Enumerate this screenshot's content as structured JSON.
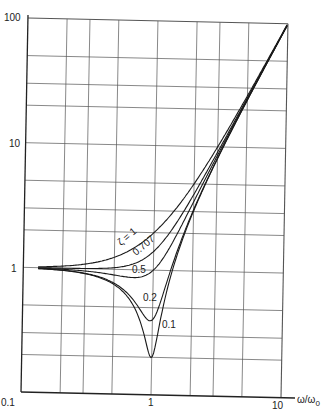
{
  "chart_data": {
    "type": "line",
    "title": "",
    "xlabel": "ω/ω0",
    "ylabel": "",
    "xscale": "log",
    "yscale": "log",
    "xlim": [
      0.1,
      10
    ],
    "ylim": [
      0.1,
      100
    ],
    "grid": true,
    "x_tick_labels": [
      "0.1",
      "1",
      "10"
    ],
    "y_tick_labels": [
      "100",
      "10",
      "1"
    ],
    "x_minor_gridlines": [
      0.2,
      0.3,
      0.5,
      2,
      3,
      5
    ],
    "y_minor_gridlines": [
      0.2,
      0.3,
      0.5,
      2,
      3,
      5,
      20,
      30,
      50
    ],
    "x": [
      0.15,
      0.2,
      0.3,
      0.4,
      0.5,
      0.6,
      0.7,
      0.8,
      0.9,
      0.95,
      1.0,
      1.05,
      1.1,
      1.2,
      1.5,
      2,
      3,
      5,
      7,
      10
    ],
    "series": [
      {
        "name": "ζ = 1",
        "label": "ζ = 1",
        "values": [
          1.023,
          1.04,
          1.09,
          1.16,
          1.25,
          1.36,
          1.49,
          1.64,
          1.81,
          1.903,
          2.0,
          2.103,
          2.21,
          2.44,
          3.25,
          5.0,
          10.0,
          26.0,
          50.0,
          101.0
        ]
      },
      {
        "name": "ζ = 0.707",
        "label": "0.707",
        "values": [
          1.0,
          1.001,
          1.004,
          1.013,
          1.031,
          1.063,
          1.113,
          1.185,
          1.281,
          1.339,
          1.414,
          1.495,
          1.582,
          1.776,
          2.462,
          4.123,
          9.055,
          25.02,
          49.01,
          100.0
        ]
      },
      {
        "name": "ζ = 0.5",
        "label": "0.5",
        "values": [
          0.989,
          0.981,
          0.958,
          0.93,
          0.901,
          0.877,
          0.866,
          0.877,
          0.92,
          0.955,
          1.0,
          1.055,
          1.12,
          1.278,
          1.953,
          3.606,
          8.544,
          24.52,
          48.51,
          99.5
        ]
      },
      {
        "name": "ζ = 0.2",
        "label": "0.2",
        "values": [
          0.979,
          0.963,
          0.918,
          0.855,
          0.776,
          0.684,
          0.582,
          0.482,
          0.407,
          0.392,
          0.4,
          0.432,
          0.488,
          0.651,
          1.387,
          3.105,
          8.09,
          24.08,
          48.08,
          99.08
        ]
      },
      {
        "name": "ζ = 0.1",
        "label": "0.1",
        "values": [
          0.978,
          0.961,
          0.912,
          0.844,
          0.757,
          0.651,
          0.529,
          0.394,
          0.262,
          0.214,
          0.2,
          0.234,
          0.304,
          0.501,
          1.285,
          3.027,
          8.02,
          24.02,
          48.02,
          99.02
        ]
      }
    ],
    "annotations": [
      {
        "text": "ζ = 1",
        "near_x": 0.8,
        "rotated": true
      },
      {
        "text": "0.707",
        "near_x": 0.8,
        "rotated": true
      },
      {
        "text": "0.5",
        "near_x": 0.7
      },
      {
        "text": "0.2",
        "near_x": 0.85
      },
      {
        "text": "0.1",
        "near_x": 1.25
      }
    ]
  },
  "labels": {
    "x_axis_symbol": "ω/ω",
    "x_axis_subscript": "0",
    "x_ticks": {
      "t01": "0.1",
      "t1": "1",
      "t10": "10"
    },
    "y_ticks": {
      "t100": "100",
      "t10": "10",
      "t1": "1"
    },
    "curves": {
      "z1": "ζ = 1",
      "z0707": "0.707",
      "z05": "0.5",
      "z02": "0.2",
      "z01": "0.1"
    }
  }
}
